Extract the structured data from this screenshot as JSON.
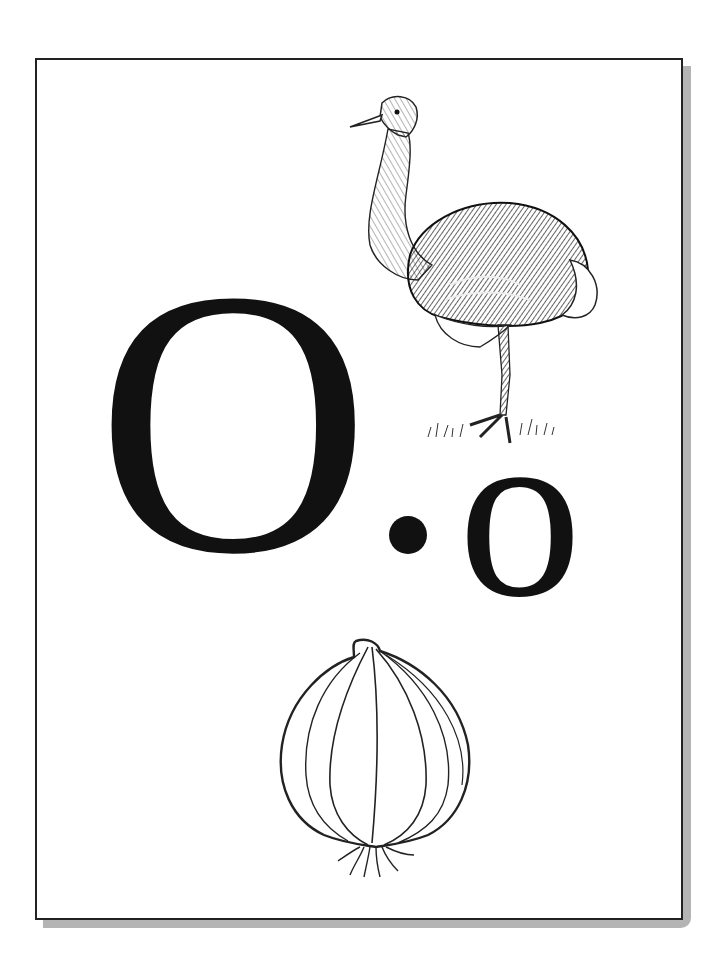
{
  "card": {
    "uppercase_letter": "O",
    "separator": "•",
    "lowercase_letter": "o",
    "illustrations": [
      {
        "name": "ostrich",
        "style": "engraved line art"
      },
      {
        "name": "onion",
        "style": "line art"
      }
    ]
  },
  "colors": {
    "ink": "#111111",
    "border": "#222222",
    "shadow": "#b4b4b4",
    "paper": "#ffffff"
  }
}
